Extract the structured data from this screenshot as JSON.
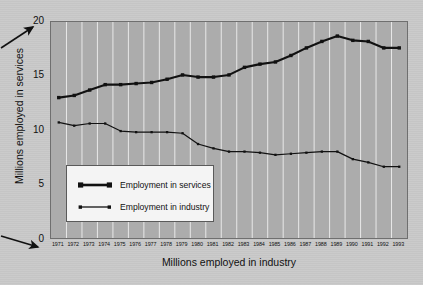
{
  "chart_data": {
    "type": "line",
    "title": "",
    "xlabel": "Millions employed in industry",
    "ylabel": "Millions employed in services",
    "ylim": [
      0,
      20
    ],
    "yticks": [
      0,
      5,
      10,
      15,
      20
    ],
    "grid": "vertical",
    "legend_position": "inside-lower-left",
    "categories": [
      "1971",
      "1972",
      "1973",
      "1974",
      "1975",
      "1976",
      "1977",
      "1978",
      "1979",
      "1980",
      "1981",
      "1982",
      "1983",
      "1984",
      "1985",
      "1986",
      "1987",
      "1988",
      "1989",
      "1990",
      "1991",
      "1992",
      "1993"
    ],
    "series": [
      {
        "name": "Employment in services",
        "color": "#111111",
        "marker": "square",
        "line_width": "thick",
        "values": [
          13.0,
          13.2,
          13.7,
          14.2,
          14.2,
          14.3,
          14.4,
          14.7,
          15.1,
          14.9,
          14.9,
          15.1,
          15.8,
          16.1,
          16.3,
          16.9,
          17.6,
          18.2,
          18.7,
          18.3,
          18.2,
          17.6,
          17.6
        ]
      },
      {
        "name": "Employment in industry",
        "color": "#111111",
        "marker": "dot",
        "line_width": "thin",
        "values": [
          10.7,
          10.4,
          10.6,
          10.6,
          9.9,
          9.8,
          9.8,
          9.8,
          9.7,
          8.7,
          8.3,
          8.0,
          8.0,
          7.9,
          7.7,
          7.8,
          7.9,
          8.0,
          8.0,
          7.3,
          7.0,
          6.6,
          6.6
        ]
      }
    ]
  },
  "annotations": {
    "arrow_top_label": "",
    "arrow_bottom_label": ""
  },
  "legend": {
    "items": [
      {
        "label": "Employment in services"
      },
      {
        "label": "Employment in industry"
      }
    ]
  },
  "colors": {
    "canvas": "#c9c9c9",
    "plot_background": "#acacac",
    "gridline": "#e8e8e8",
    "axis": "#6f6f6f",
    "series": "#111111",
    "legend_background": "#f4f4f4"
  }
}
